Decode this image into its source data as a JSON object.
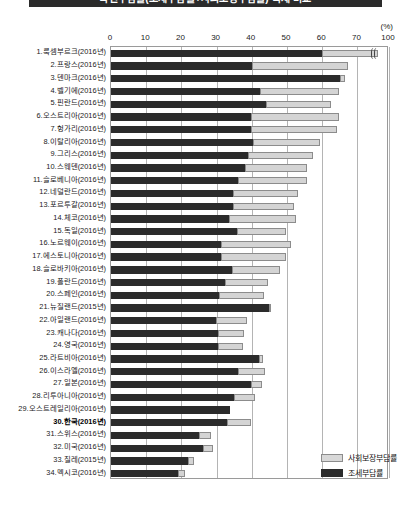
{
  "title": "국민부담률(조세부담률+사회보장부담률) 국제 비교",
  "unit_label": "(%)",
  "legend": {
    "position": "bottom-right",
    "items": [
      {
        "key": "social",
        "label": "사회보장부담률",
        "color": "#d8d8d8"
      },
      {
        "key": "tax",
        "label": "조세부담률",
        "color": "#2b2b2b"
      }
    ]
  },
  "axis": {
    "ticks": [
      0,
      10,
      20,
      30,
      40,
      50,
      60,
      70,
      100
    ],
    "break_between": [
      70,
      100
    ],
    "label_unit": "(%)"
  },
  "chart_data": {
    "type": "bar",
    "orientation": "horizontal",
    "stacked": true,
    "title": "국민부담률(조세부담률+사회보장부담률) 국제 비교",
    "xlabel": "(%)",
    "ylabel": "",
    "xlim": [
      0,
      100
    ],
    "xticks": [
      0,
      10,
      20,
      30,
      40,
      50,
      60,
      70,
      100
    ],
    "axis_break": [
      70,
      100
    ],
    "grid": true,
    "legend_position": "bottom-right",
    "categories": [
      "1.룩셈부르크(2016년)",
      "2.프랑스(2016년)",
      "3.덴마크(2016년)",
      "4.벨기에(2016년)",
      "5.핀란드(2016년)",
      "6.오스트리아(2016년)",
      "7.헝가리(2016년)",
      "8.이탈리아(2016년)",
      "9.그리스(2016년)",
      "10.스웨덴(2016년)",
      "11.슬로베니아(2016년)",
      "12.네덜란드(2016년)",
      "13.포르투갈(2016년)",
      "14.체코(2016년)",
      "15.독일(2016년)",
      "16.노르웨이(2016년)",
      "17.에스토니아(2016년)",
      "18.슬로바키아(2016년)",
      "19.폴란드(2016년)",
      "20.스페인(2016년)",
      "21.뉴질랜드(2015년)",
      "22.아일랜드(2016년)",
      "23.캐나다(2016년)",
      "24.영국(2016년)",
      "25.라트비아(2016년)",
      "26.이스라엘(2016년)",
      "27.일본(2016년)",
      "28.리투아니아(2016년)",
      "29.오스트레일리아(2016년)",
      "30.한국(2016년)",
      "31.스위스(2016년)",
      "32.미국(2016년)",
      "33.칠레(2015년)",
      "34.멕시코(2016년)"
    ],
    "highlight_category": "30.한국(2016년)",
    "series": [
      {
        "name": "조세부담률",
        "color": "#2b2b2b",
        "values": [
          60.0,
          40.1,
          65.0,
          42.2,
          44.1,
          39.9,
          39.9,
          40.3,
          39.0,
          38.0,
          36.0,
          34.6,
          34.8,
          33.4,
          35.7,
          31.3,
          31.3,
          34.3,
          32.5,
          30.7,
          44.8,
          29.9,
          30.4,
          30.4,
          42.0,
          36.1,
          39.9,
          35.0,
          33.9,
          33.0,
          25.0,
          26.2,
          21.9,
          19.0
        ]
      },
      {
        "name": "사회보장부담률",
        "color": "#d8d8d8",
        "values": [
          30.0,
          27.2,
          1.4,
          22.7,
          18.3,
          24.9,
          24.4,
          19.1,
          18.5,
          17.7,
          19.8,
          18.4,
          17.2,
          19.2,
          14.0,
          19.8,
          18.5,
          13.6,
          12.0,
          12.7,
          0.6,
          8.8,
          7.5,
          7.2,
          1.2,
          7.6,
          3.0,
          6.0,
          0.0,
          6.8,
          3.4,
          2.9,
          1.7,
          2.0
        ]
      }
    ]
  }
}
